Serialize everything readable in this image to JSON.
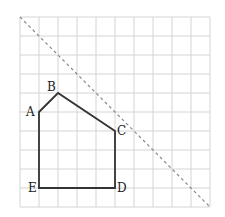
{
  "diagram": {
    "type": "geometry-grid",
    "grid": {
      "origin_x": 20,
      "origin_y": 17,
      "cell_size": 19,
      "cols": 10,
      "rows": 10,
      "line_color": "#d4d4d4"
    },
    "polygon": {
      "stroke_color": "#333333",
      "vertices": [
        {
          "name": "A",
          "gx": 1,
          "gy": 5
        },
        {
          "name": "B",
          "gx": 2,
          "gy": 4
        },
        {
          "name": "C",
          "gx": 5,
          "gy": 6
        },
        {
          "name": "D",
          "gx": 5,
          "gy": 9
        },
        {
          "name": "E",
          "gx": 1,
          "gy": 9
        }
      ]
    },
    "labels": {
      "A": "A",
      "B": "B",
      "C": "C",
      "D": "D",
      "E": "E"
    },
    "dashed_line": {
      "from": {
        "gx": 0,
        "gy": 0
      },
      "to": {
        "gx": 10,
        "gy": 10
      },
      "color": "#888888"
    }
  }
}
